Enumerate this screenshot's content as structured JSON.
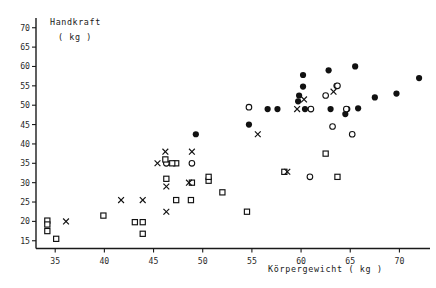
{
  "chart_data": {
    "type": "scatter",
    "title": "",
    "ylabel_line1": "Handkraft",
    "ylabel_line2": "( kg )",
    "xlabel": "Körpergewicht   ( kg )",
    "xlim": [
      33.2,
      72.5
    ],
    "ylim": [
      13.0,
      72.0
    ],
    "xticks": [
      35,
      40,
      45,
      50,
      55,
      60,
      65,
      70
    ],
    "yticks": [
      15,
      20,
      25,
      30,
      35,
      40,
      45,
      50,
      55,
      60,
      65,
      70
    ],
    "xtick_labels": [
      "35",
      "40",
      "45",
      "50",
      "55",
      "60",
      "65",
      "70"
    ],
    "ytick_labels": [
      "15",
      "20",
      "25",
      "30",
      "35",
      "40",
      "45",
      "50",
      "55",
      "60",
      "65",
      "70"
    ],
    "grid": false,
    "legend": "none",
    "series": [
      {
        "name": "filled-circle",
        "marker": "filled-circle",
        "color": "#111111",
        "points": [
          [
            49.3,
            42.5
          ],
          [
            54.7,
            45.0
          ],
          [
            56.6,
            49.0
          ],
          [
            57.6,
            49.0
          ],
          [
            60.2,
            57.8
          ],
          [
            60.2,
            54.8
          ],
          [
            60.4,
            49.0
          ],
          [
            59.7,
            51.0
          ],
          [
            59.8,
            52.5
          ],
          [
            62.8,
            59.0
          ],
          [
            63.6,
            55.0
          ],
          [
            63.0,
            49.0
          ],
          [
            64.7,
            49.0
          ],
          [
            64.5,
            47.7
          ],
          [
            65.5,
            60.0
          ],
          [
            65.8,
            49.2
          ],
          [
            67.5,
            52.0
          ],
          [
            69.7,
            53.0
          ],
          [
            72.0,
            57.0
          ]
        ]
      },
      {
        "name": "open-circle",
        "marker": "open-circle",
        "color": "#111111",
        "points": [
          [
            46.3,
            35.0
          ],
          [
            48.9,
            35.0
          ],
          [
            54.7,
            49.5
          ],
          [
            61.0,
            49.0
          ],
          [
            62.5,
            52.5
          ],
          [
            63.7,
            55.0
          ],
          [
            63.2,
            44.5
          ],
          [
            64.6,
            49.0
          ],
          [
            65.2,
            42.5
          ],
          [
            60.9,
            31.5
          ]
        ]
      },
      {
        "name": "open-square",
        "marker": "open-square",
        "color": "#111111",
        "points": [
          [
            34.2,
            20.2
          ],
          [
            34.2,
            19.2
          ],
          [
            34.2,
            17.5
          ],
          [
            35.1,
            15.5
          ],
          [
            39.9,
            21.5
          ],
          [
            43.1,
            19.8
          ],
          [
            43.9,
            19.8
          ],
          [
            43.9,
            16.8
          ],
          [
            46.2,
            36.0
          ],
          [
            46.3,
            31.0
          ],
          [
            47.3,
            35.0
          ],
          [
            47.3,
            25.5
          ],
          [
            46.9,
            35.0
          ],
          [
            48.8,
            25.5
          ],
          [
            48.9,
            30.0
          ],
          [
            50.6,
            30.5
          ],
          [
            50.6,
            31.5
          ],
          [
            52.0,
            27.5
          ],
          [
            54.5,
            22.5
          ],
          [
            58.3,
            32.8
          ],
          [
            62.5,
            37.5
          ],
          [
            63.7,
            31.5
          ]
        ]
      },
      {
        "name": "cross",
        "marker": "x",
        "color": "#111111",
        "points": [
          [
            36.1,
            20.0
          ],
          [
            41.7,
            25.5
          ],
          [
            43.9,
            25.5
          ],
          [
            45.4,
            35.0
          ],
          [
            46.2,
            38.0
          ],
          [
            46.3,
            29.0
          ],
          [
            46.3,
            22.5
          ],
          [
            48.6,
            30.0
          ],
          [
            48.9,
            38.0
          ],
          [
            55.6,
            42.5
          ],
          [
            59.6,
            49.0
          ],
          [
            60.3,
            51.5
          ],
          [
            58.6,
            32.8
          ],
          [
            63.3,
            53.5
          ]
        ]
      }
    ]
  },
  "axes": {
    "x_axis_name": "Körpergewicht",
    "y_axis_name": "Handkraft",
    "unit": "( kg )"
  }
}
